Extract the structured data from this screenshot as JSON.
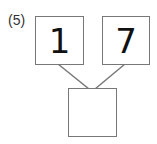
{
  "problem": {
    "label": "(5)",
    "top_left_value": "1",
    "top_right_value": "7",
    "bottom_value": ""
  },
  "colors": {
    "border": "#777777",
    "text": "#111111"
  }
}
